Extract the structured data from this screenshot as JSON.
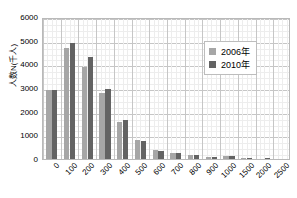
{
  "chart_data": {
    "type": "bar",
    "title": "",
    "subtitle": "",
    "xlabel": "",
    "ylabel": "人数N(千人)",
    "categories": [
      "0",
      "100",
      "200",
      "300",
      "400",
      "500",
      "600",
      "700",
      "800",
      "900",
      "1000",
      "1500",
      "2000",
      "2500"
    ],
    "series": [
      {
        "name": "2006年",
        "color": "#a6a6a6",
        "values": [
          2900,
          4700,
          3900,
          2800,
          1550,
          800,
          370,
          250,
          150,
          90,
          120,
          35,
          20,
          10
        ]
      },
      {
        "name": "2010年",
        "color": "#636363",
        "values": [
          2900,
          4900,
          4300,
          2950,
          1650,
          760,
          330,
          240,
          170,
          80,
          110,
          30,
          55,
          15
        ]
      }
    ],
    "ylim": [
      0,
      6000
    ],
    "ytick_values": [
      0,
      1000,
      2000,
      3000,
      4000,
      5000,
      6000
    ],
    "ytick_labels": [
      "0",
      "1000",
      "2000",
      "3000",
      "4000",
      "5000",
      "6000"
    ],
    "grid": {
      "major_horizontal": true,
      "minor_horizontal": true,
      "major_vertical": true,
      "minor_vertical": true,
      "minor_divisions": 4
    },
    "legend": {
      "position": "top-right-inside",
      "entries": [
        "2006年",
        "2010年"
      ]
    },
    "plot_border_color": "#b9b9b9",
    "background_color": "#ffffff"
  }
}
